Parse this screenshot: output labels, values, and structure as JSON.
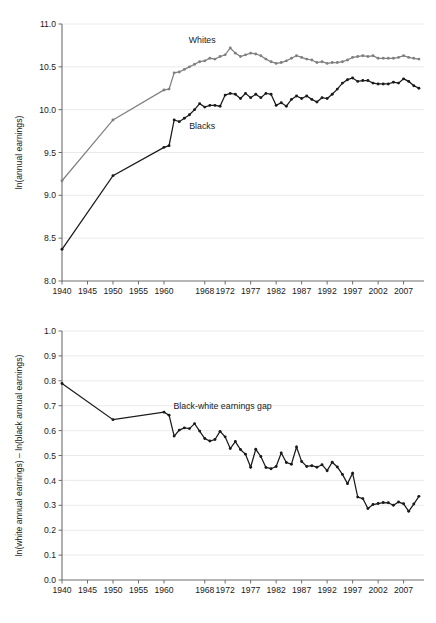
{
  "figure": {
    "background_color": "#ffffff",
    "panels": [
      "top-earnings-levels",
      "bottom-earnings-gap"
    ]
  },
  "colors": {
    "whites_series": "#808080",
    "blacks_series": "#1a1a1a",
    "gap_series": "#1a1a1a",
    "axis": "#6e6e6e",
    "grid": "#e8e8e8",
    "text": "#1a1a1a"
  },
  "chart_data": [
    {
      "type": "line",
      "id": "top-earnings-levels",
      "title": "",
      "xlabel": "",
      "ylabel": "ln(annual earnings)",
      "xlim": [
        1940,
        2011
      ],
      "ylim": [
        8.0,
        11.0
      ],
      "grid": true,
      "legend_position": "inline-annotation",
      "y_ticks": [
        "8.0",
        "8.5",
        "9.0",
        "9.5",
        "10.0",
        "10.5",
        "11.0"
      ],
      "y_tick_values": [
        8.0,
        8.5,
        9.0,
        9.5,
        10.0,
        10.5,
        11.0
      ],
      "x_ticks": [
        "1940",
        "1945",
        "1950",
        "1955",
        "1960",
        "1968",
        "1972",
        "1977",
        "1982",
        "1987",
        "1992",
        "1997",
        "2002",
        "2007"
      ],
      "x_tick_values": [
        1940,
        1945,
        1950,
        1955,
        1960,
        1968,
        1972,
        1977,
        1982,
        1987,
        1992,
        1997,
        2002,
        2007
      ],
      "annotations": [
        {
          "text": "Whites",
          "x": 1967.5,
          "y": 10.78
        },
        {
          "text": "Blacks",
          "x": 1967.5,
          "y": 9.78
        }
      ],
      "series": [
        {
          "name": "Whites",
          "color": "#808080",
          "x": [
            1940,
            1950,
            1960,
            1961,
            1962,
            1963,
            1964,
            1965,
            1966,
            1967,
            1968,
            1969,
            1970,
            1971,
            1972,
            1973,
            1974,
            1975,
            1976,
            1977,
            1978,
            1979,
            1980,
            1981,
            1982,
            1983,
            1984,
            1985,
            1986,
            1987,
            1988,
            1989,
            1990,
            1991,
            1992,
            1993,
            1994,
            1995,
            1996,
            1997,
            1998,
            1999,
            2000,
            2001,
            2002,
            2003,
            2004,
            2005,
            2006,
            2007,
            2008,
            2009,
            2010
          ],
          "values": [
            9.17,
            9.88,
            10.23,
            10.24,
            10.43,
            10.44,
            10.47,
            10.5,
            10.53,
            10.56,
            10.57,
            10.6,
            10.59,
            10.62,
            10.64,
            10.72,
            10.66,
            10.62,
            10.64,
            10.66,
            10.65,
            10.63,
            10.59,
            10.56,
            10.54,
            10.55,
            10.57,
            10.6,
            10.63,
            10.61,
            10.59,
            10.58,
            10.55,
            10.56,
            10.54,
            10.55,
            10.55,
            10.56,
            10.58,
            10.61,
            10.62,
            10.63,
            10.62,
            10.63,
            10.6,
            10.6,
            10.6,
            10.6,
            10.61,
            10.63,
            10.61,
            10.6,
            10.59
          ]
        },
        {
          "name": "Blacks",
          "color": "#1a1a1a",
          "x": [
            1940,
            1950,
            1960,
            1961,
            1962,
            1963,
            1964,
            1965,
            1966,
            1967,
            1968,
            1969,
            1970,
            1971,
            1972,
            1973,
            1974,
            1975,
            1976,
            1977,
            1978,
            1979,
            1980,
            1981,
            1982,
            1983,
            1984,
            1985,
            1986,
            1987,
            1988,
            1989,
            1990,
            1991,
            1992,
            1993,
            1994,
            1995,
            1996,
            1997,
            1998,
            1999,
            2000,
            2001,
            2002,
            2003,
            2004,
            2005,
            2006,
            2007,
            2008,
            2009,
            2010
          ],
          "values": [
            8.37,
            9.23,
            9.56,
            9.58,
            9.88,
            9.86,
            9.9,
            9.94,
            10.0,
            10.07,
            10.03,
            10.05,
            10.05,
            10.04,
            10.17,
            10.19,
            10.18,
            10.13,
            10.19,
            10.14,
            10.18,
            10.14,
            10.19,
            10.18,
            10.05,
            10.08,
            10.04,
            10.12,
            10.16,
            10.13,
            10.16,
            10.12,
            10.09,
            10.14,
            10.13,
            10.18,
            10.24,
            10.31,
            10.35,
            10.37,
            10.33,
            10.34,
            10.34,
            10.31,
            10.3,
            10.3,
            10.3,
            10.32,
            10.31,
            10.36,
            10.33,
            10.28,
            10.25
          ]
        }
      ]
    },
    {
      "type": "line",
      "id": "bottom-earnings-gap",
      "title": "",
      "xlabel": "",
      "ylabel": "ln(white annual earnings) – ln(black annual earnings)",
      "xlim": [
        1940,
        2011
      ],
      "ylim": [
        0.0,
        1.0
      ],
      "grid": true,
      "legend_position": "inline-annotation",
      "y_ticks": [
        "0.0",
        "0.1",
        "0.2",
        "0.3",
        "0.4",
        "0.5",
        "0.6",
        "0.7",
        "0.8",
        "0.9",
        "1.0"
      ],
      "y_tick_values": [
        0.0,
        0.1,
        0.2,
        0.3,
        0.4,
        0.5,
        0.6,
        0.7,
        0.8,
        0.9,
        1.0
      ],
      "x_ticks": [
        "1940",
        "1945",
        "1950",
        "1955",
        "1960",
        "1968",
        "1972",
        "1977",
        "1982",
        "1987",
        "1992",
        "1997",
        "2002",
        "2007"
      ],
      "x_tick_values": [
        1940,
        1945,
        1950,
        1955,
        1960,
        1968,
        1972,
        1977,
        1982,
        1987,
        1992,
        1997,
        2002,
        2007
      ],
      "annotations": [
        {
          "text": "Black-white earnings gap",
          "x": 1971.5,
          "y": 0.685
        }
      ],
      "series": [
        {
          "name": "Black-white earnings gap",
          "color": "#1a1a1a",
          "x": [
            1940,
            1950,
            1960,
            1961,
            1962,
            1963,
            1964,
            1965,
            1966,
            1967,
            1968,
            1969,
            1970,
            1971,
            1972,
            1973,
            1974,
            1975,
            1976,
            1977,
            1978,
            1979,
            1980,
            1981,
            1982,
            1983,
            1984,
            1985,
            1986,
            1987,
            1988,
            1989,
            1990,
            1991,
            1992,
            1993,
            1994,
            1995,
            1996,
            1997,
            1998,
            1999,
            2000,
            2001,
            2002,
            2003,
            2004,
            2005,
            2006,
            2007,
            2008,
            2009,
            2010
          ],
          "values": [
            0.789,
            0.644,
            0.674,
            0.662,
            0.578,
            0.602,
            0.611,
            0.608,
            0.628,
            0.598,
            0.568,
            0.558,
            0.564,
            0.597,
            0.575,
            0.528,
            0.556,
            0.524,
            0.505,
            0.453,
            0.525,
            0.496,
            0.452,
            0.447,
            0.456,
            0.51,
            0.472,
            0.465,
            0.534,
            0.476,
            0.456,
            0.459,
            0.453,
            0.463,
            0.439,
            0.473,
            0.454,
            0.424,
            0.387,
            0.429,
            0.333,
            0.327,
            0.287,
            0.303,
            0.307,
            0.311,
            0.31,
            0.3,
            0.313,
            0.306,
            0.276,
            0.305,
            0.336
          ]
        }
      ]
    }
  ]
}
